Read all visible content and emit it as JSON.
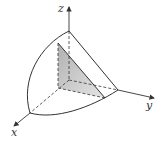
{
  "diagram": {
    "type": "3d-solid-region",
    "axes": {
      "x_label": "x",
      "y_label": "y",
      "z_label": "z"
    },
    "colors": {
      "line": "#333333",
      "shade_light": "#e2e2e2",
      "shade_dark": "#a8a8a8",
      "background": "#ffffff"
    }
  }
}
